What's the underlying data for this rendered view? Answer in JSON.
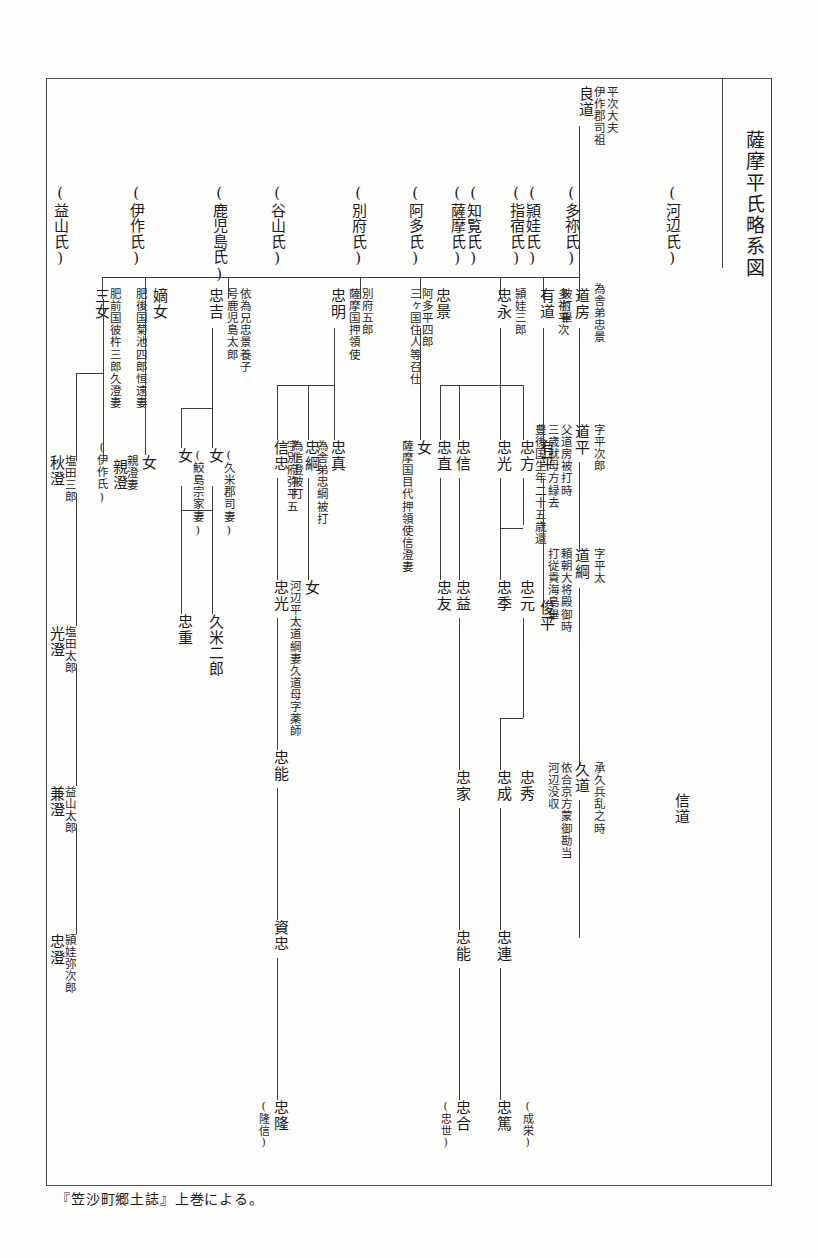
{
  "document": {
    "title": "薩摩平氏略系図",
    "caption": "『笠沙町郷土誌』上巻による。",
    "line_color": "#3d3d3d",
    "frame_color": "#4a4a4a",
    "text_color": "#1a1a1a"
  },
  "clans": [
    {
      "label": "(益山氏)"
    },
    {
      "label": "(伊作氏)"
    },
    {
      "label": "(鹿児島氏)"
    },
    {
      "label": "(谷山氏)"
    },
    {
      "label": "(別府氏)"
    },
    {
      "label": "(阿多氏)"
    },
    {
      "label": "(薩摩氏)"
    },
    {
      "label": "(知覧氏)"
    },
    {
      "label": "(指宿氏)"
    },
    {
      "label": "(頴娃氏)"
    },
    {
      "label": "(多祢氏)"
    },
    {
      "label": "(河辺氏)"
    }
  ],
  "root": {
    "ancestor_title": "平次大夫\n伊作郡司祖",
    "ancestor_title_line1": "平次大夫",
    "ancestor_title_line2": "伊作郡司祖",
    "name": "良道"
  },
  "kawanabe_line": {
    "gen1_name": "道房",
    "gen1_note_right": "為舎弟忠景",
    "gen1_note_left": "被打畢",
    "gen2_name": "道平",
    "gen2_note_right": "字平次郎",
    "gen2_note_a": "父道房被打時",
    "gen2_note_b": "三歳就母方緑去",
    "gen2_note_c": "豊後国生年二十五歳還",
    "gen3_name": "道綱",
    "gen3_note_right": "字平太",
    "gen3_note_a": "頼朝大将殿御時",
    "gen3_note_b": "打従貴海島畢",
    "gen4_name": "久道",
    "gen4_note_right": "承久兵乱之時",
    "gen4_note_a": "依合京方蒙御勘当",
    "gen4_note_b": "河辺没収",
    "gen5_name": "信道"
  },
  "tane_line": {
    "gen1_name": "有道",
    "gen1_note": "多祢平次",
    "gen2_name": "有平",
    "gen3_name": "俊平"
  },
  "tadanaga_line": {
    "name": "忠永",
    "note": "頴娃三郎",
    "children": [
      {
        "name": "忠方"
      },
      {
        "name": "忠光"
      },
      {
        "name": "忠信"
      },
      {
        "name": "忠直"
      }
    ],
    "tadamitsu_children": [
      {
        "name": "忠元"
      },
      {
        "name": "忠季"
      }
    ],
    "tadamoto_d": "忠友",
    "tadashin_d": "忠益",
    "tadamoto_d2": "忠家",
    "tadamoto_d3": "忠能",
    "tadamoto_d4": "忠合",
    "tadamoto_d4_alt": "(忠世)",
    "tadamoto_col_hide": "",
    "tadagen_children": [
      {
        "name": "忠秀"
      },
      {
        "name": "忠成"
      }
    ],
    "tadanari_d": "忠連",
    "tadanari_d2": "忠篤",
    "tadanari_alt": "(成栄)"
  },
  "ata_line": {
    "name": "忠景",
    "note_a": "阿多平四郎",
    "note_b": "三ヶ国住人等召仕",
    "daughter": "女",
    "daughter_note": "薩摩国目代押領使信澄妻"
  },
  "beppu_line": {
    "name": "忠明",
    "note_a": "別府五郎",
    "note_b": "薩摩国押領使",
    "children": [
      {
        "name": "忠真",
        "note": "為舎弟忠綱被打"
      },
      {
        "name": "忠綱",
        "note": "為信澄被打"
      },
      {
        "name": "信忠",
        "note": "字別府弥平五"
      }
    ],
    "tadatsuna_daughter": "女",
    "tadatsuna_daughter_note": "河辺平太道綱妻久道母字薬師",
    "nobutada_desc": [
      "忠光",
      "忠能",
      "資忠",
      "忠隆"
    ],
    "nobutada_last_alt": "(隆信)"
  },
  "kagoshima_line": {
    "name": "忠吉",
    "note_a": "依為兄忠景養子",
    "note_b": "号鹿児島太郎",
    "children": [
      {
        "name": "女",
        "note": "(久米郡司妻)"
      },
      {
        "name": "女",
        "note": "(鮫島宗家妻)"
      }
    ],
    "desc_right": "久米二郎",
    "desc_left": "忠重"
  },
  "izaku_line": {
    "heir_daughter": "嫡女",
    "heir_daughter_note": "肥後国菊池四郎恒遠妻",
    "third_daughter": "三女",
    "third_daughter_note": "肥前国彼杵三郎久澄妻",
    "izaku_tag": "(伊作氏)",
    "heir_child": "女",
    "heir_child_note": "親澄妻",
    "third_child": "親澄"
  },
  "masuyama_line": {
    "gen1": "秋澄",
    "gen1_note": "塩田三郎",
    "gen2": "光澄",
    "gen2_note": "塩田太郎",
    "gen3": "兼澄",
    "gen3_note": "益山太郎",
    "gen4": "忠澄",
    "gen4_note": "頴娃弥次郎"
  }
}
